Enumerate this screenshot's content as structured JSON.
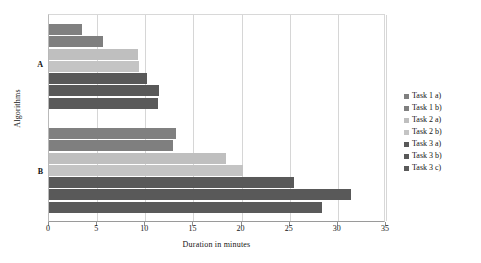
{
  "chart_data": {
    "type": "bar",
    "orientation": "horizontal",
    "title": "",
    "xlabel": "Duration in minutes",
    "ylabel": "Algorithms",
    "categories": [
      "A",
      "B"
    ],
    "xlim": [
      0,
      35
    ],
    "xticks": [
      0,
      5,
      10,
      15,
      20,
      25,
      30,
      35
    ],
    "xtick_labels": [
      "0",
      "5",
      "10",
      "15",
      "20",
      "25",
      "30",
      "35"
    ],
    "grid": true,
    "legend_position": "right",
    "series": [
      {
        "name": "Task 1 a)",
        "color": "#808080",
        "values": [
          3.4,
          13.2
        ]
      },
      {
        "name": "Task 1 b)",
        "color": "#7f7f7f",
        "values": [
          5.6,
          12.9
        ]
      },
      {
        "name": "Task 2 a)",
        "color": "#bfbfbf",
        "values": [
          9.2,
          18.4
        ]
      },
      {
        "name": "Task 2 b)",
        "color": "#c4c4c4",
        "values": [
          9.3,
          20.1
        ]
      },
      {
        "name": "Task 3 a)",
        "color": "#595959",
        "values": [
          10.2,
          25.4
        ]
      },
      {
        "name": "Task 3 b)",
        "color": "#595959",
        "values": [
          11.4,
          31.4
        ]
      },
      {
        "name": "Task 3 c)",
        "color": "#5a5a5a",
        "values": [
          11.3,
          28.4
        ]
      }
    ]
  },
  "legend": {
    "items": [
      {
        "label": "Task 1 a)",
        "color": "#808080"
      },
      {
        "label": "Task 1 b)",
        "color": "#7f7f7f"
      },
      {
        "label": "Task 2 a)",
        "color": "#bfbfbf"
      },
      {
        "label": "Task 2 b)",
        "color": "#c4c4c4"
      },
      {
        "label": "Task 3 a)",
        "color": "#595959"
      },
      {
        "label": "Task 3 b)",
        "color": "#595959"
      },
      {
        "label": "Task 3 c)",
        "color": "#5a5a5a"
      }
    ]
  }
}
